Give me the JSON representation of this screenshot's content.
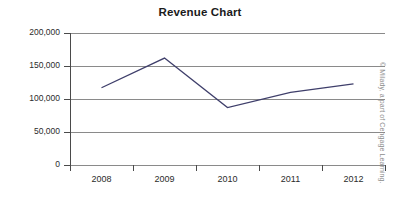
{
  "chart_data": {
    "type": "line",
    "title": "Revenue Chart",
    "xlabel": "",
    "ylabel": "",
    "categories": [
      "2008",
      "2009",
      "2010",
      "2011",
      "2012"
    ],
    "series": [
      {
        "name": "Revenue",
        "values": [
          117000,
          162000,
          87000,
          110000,
          123000
        ],
        "color": "#3f3f6b"
      }
    ],
    "ylim": [
      0,
      200000
    ],
    "ytick_values": [
      0,
      50000,
      100000,
      150000,
      200000
    ],
    "ytick_labels": [
      "0",
      "50,000",
      "100,000",
      "150,000",
      "200,000"
    ],
    "grid": true,
    "legend": "none"
  },
  "credit": {
    "text": "© Milady, a part of Cengage Learning."
  }
}
